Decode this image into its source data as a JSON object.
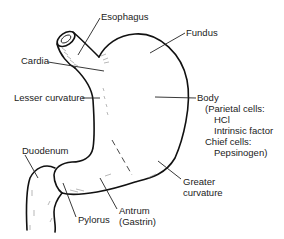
{
  "diagram": {
    "labels": {
      "esophagus": "Esophagus",
      "fundus": "Fundus",
      "cardia": "Cardia",
      "lesser_curvature": "Lesser curvature",
      "body": "Body",
      "body_details": [
        "(Parietal cells:",
        "HCl",
        "Intrinsic factor",
        "Chief cells:",
        "Pepsinogen)"
      ],
      "duodenum": "Duodenum",
      "greater_curvature": [
        "Greater",
        "curvature"
      ],
      "pylorus": "Pylorus",
      "antrum": [
        "Antrum",
        "(Gastrin)"
      ]
    },
    "colors": {
      "line": "#111111",
      "text": "#222222",
      "background": "#ffffff"
    }
  }
}
